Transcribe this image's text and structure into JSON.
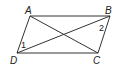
{
  "diagram": {
    "type": "parallelogram",
    "vertices": [
      {
        "name": "A",
        "x": 30,
        "y": 16
      },
      {
        "name": "B",
        "x": 110,
        "y": 16
      },
      {
        "name": "C",
        "x": 98,
        "y": 53
      },
      {
        "name": "D",
        "x": 17,
        "y": 53
      }
    ],
    "labels": {
      "A": "A",
      "B": "B",
      "C": "C",
      "D": "D"
    },
    "angles": {
      "angle1": "1",
      "angle2": "2"
    },
    "diagonals": [
      "AC",
      "BD"
    ],
    "stroke_color": "#333333"
  }
}
